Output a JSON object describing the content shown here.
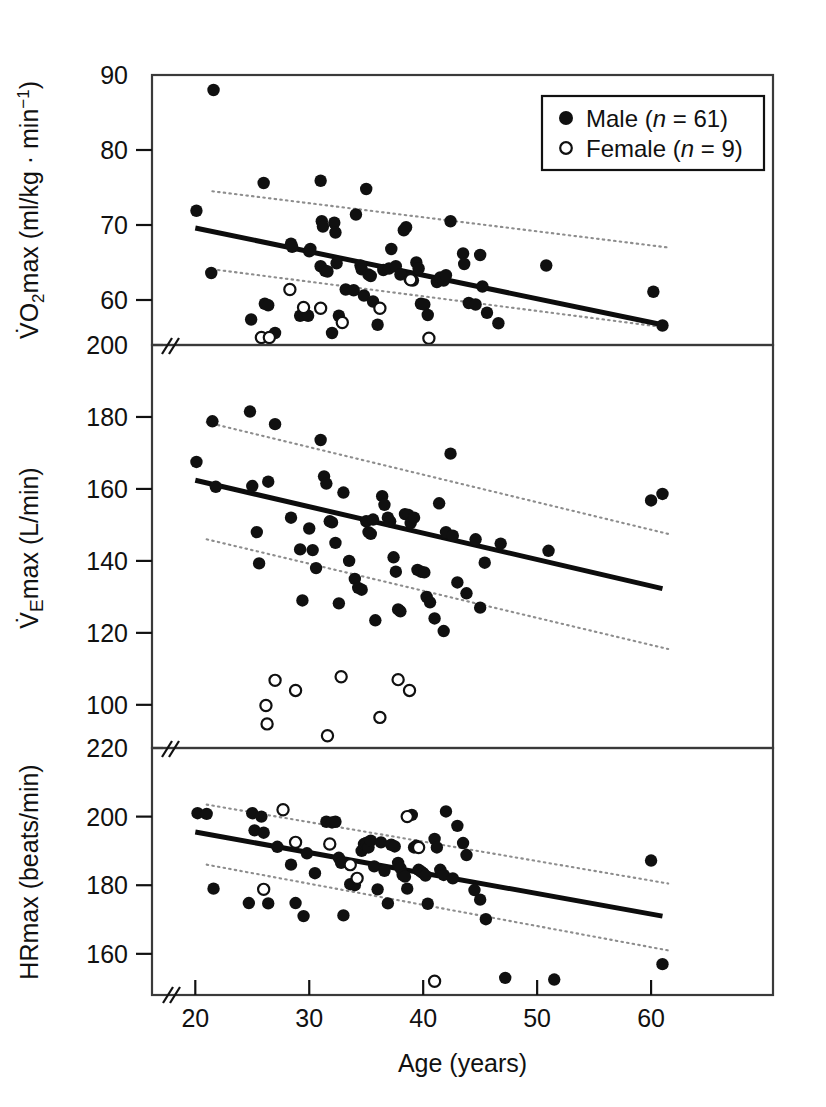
{
  "figure": {
    "xlabel": "Age (years)",
    "legend": {
      "male_label": "Male (",
      "male_n_sym": "n",
      "male_n_val": " = 61)",
      "female_label": "Female (",
      "female_n_sym": "n",
      "female_n_val": " = 9)",
      "male_marker": "filled-circle",
      "female_marker": "open-circle"
    },
    "colors": {
      "ink": "#111111",
      "marker": "#101010",
      "ci_line": "#8d8d8d",
      "frame": "#3a3a3a"
    },
    "axis_break_glyph": "//"
  },
  "chart_data": [
    {
      "type": "scatter",
      "panel": "top",
      "title": "",
      "xlabel": "Age (years)",
      "ylabel": "VO2max (ml/kg · min-1)",
      "ylabel_parts": {
        "lead": "V",
        "dot": "̇",
        "o": "O",
        "sub": "2",
        "mid": "max (ml/kg · min",
        "sup": "−1",
        "tail": ")"
      },
      "xlim": [
        16.2,
        70.7
      ],
      "ylim": [
        54.0,
        90.0
      ],
      "xticks": [
        20,
        30,
        40,
        50,
        60
      ],
      "yticks": [
        60,
        70,
        80,
        90
      ],
      "grid": false,
      "regression": {
        "x": [
          20,
          61
        ],
        "y": [
          69.6,
          56.7
        ]
      },
      "ci_upper": {
        "x": [
          21.5,
          61.5
        ],
        "y": [
          74.5,
          67.0
        ]
      },
      "ci_lower": {
        "x": [
          21.5,
          61.5
        ],
        "y": [
          64.1,
          56.3
        ]
      },
      "series": [
        {
          "name": "Male (n = 61)",
          "marker": "filled-circle",
          "points": [
            [
              20.1,
              71.9
            ],
            [
              21.6,
              88.0
            ],
            [
              21.4,
              63.6
            ],
            [
              24.9,
              57.4
            ],
            [
              26.0,
              75.6
            ],
            [
              26.1,
              59.5
            ],
            [
              26.4,
              59.3
            ],
            [
              27.0,
              55.6
            ],
            [
              28.4,
              67.5
            ],
            [
              28.5,
              67.1
            ],
            [
              29.2,
              57.9
            ],
            [
              29.9,
              57.9
            ],
            [
              30.0,
              66.5
            ],
            [
              30.1,
              66.8
            ],
            [
              31.0,
              75.9
            ],
            [
              31.1,
              70.5
            ],
            [
              31.2,
              69.8
            ],
            [
              31.0,
              64.5
            ],
            [
              31.4,
              63.9
            ],
            [
              31.6,
              63.8
            ],
            [
              32.2,
              70.3
            ],
            [
              32.3,
              69.0
            ],
            [
              32.4,
              64.9
            ],
            [
              32.0,
              55.6
            ],
            [
              32.6,
              57.9
            ],
            [
              33.2,
              61.4
            ],
            [
              33.9,
              61.3
            ],
            [
              34.1,
              71.4
            ],
            [
              34.5,
              64.6
            ],
            [
              34.6,
              64.1
            ],
            [
              34.8,
              60.6
            ],
            [
              35.0,
              74.8
            ],
            [
              35.2,
              63.4
            ],
            [
              35.4,
              63.2
            ],
            [
              35.6,
              59.8
            ],
            [
              36.0,
              56.7
            ],
            [
              36.5,
              64.0
            ],
            [
              37.0,
              64.2
            ],
            [
              37.2,
              66.8
            ],
            [
              37.6,
              64.5
            ],
            [
              38.0,
              63.4
            ],
            [
              38.3,
              69.3
            ],
            [
              38.5,
              69.7
            ],
            [
              38.8,
              62.8
            ],
            [
              39.1,
              62.6
            ],
            [
              39.4,
              65.0
            ],
            [
              39.6,
              64.2
            ],
            [
              39.8,
              59.5
            ],
            [
              40.1,
              59.4
            ],
            [
              40.4,
              58.0
            ],
            [
              41.2,
              62.4
            ],
            [
              41.5,
              63.0
            ],
            [
              41.8,
              62.6
            ],
            [
              42.0,
              63.3
            ],
            [
              42.4,
              70.5
            ],
            [
              43.5,
              66.2
            ],
            [
              43.6,
              64.8
            ],
            [
              44.0,
              59.6
            ],
            [
              44.6,
              59.4
            ],
            [
              45.0,
              66.0
            ],
            [
              45.2,
              61.8
            ],
            [
              45.6,
              58.3
            ],
            [
              46.6,
              56.9
            ],
            [
              50.8,
              64.6
            ],
            [
              60.2,
              61.1
            ],
            [
              61.0,
              56.6
            ]
          ]
        },
        {
          "name": "Female (n = 9)",
          "marker": "open-circle",
          "points": [
            [
              25.8,
              55.0
            ],
            [
              26.5,
              55.0
            ],
            [
              28.3,
              61.4
            ],
            [
              29.5,
              59.0
            ],
            [
              31.0,
              58.9
            ],
            [
              32.9,
              57.0
            ],
            [
              36.2,
              58.9
            ],
            [
              38.9,
              62.7
            ],
            [
              40.5,
              54.9
            ]
          ]
        }
      ]
    },
    {
      "type": "scatter",
      "panel": "middle",
      "title": "",
      "xlabel": "Age (years)",
      "ylabel": "VEmax (L/min)",
      "ylabel_parts": {
        "lead": "V",
        "dot": "̇",
        "sub": "E",
        "mid": "max (L/min)"
      },
      "xlim": [
        16.2,
        70.7
      ],
      "ylim": [
        88.0,
        200.0
      ],
      "xticks": [
        20,
        30,
        40,
        50,
        60
      ],
      "yticks": [
        100,
        120,
        140,
        160,
        180,
        200
      ],
      "grid": false,
      "regression": {
        "x": [
          20,
          61
        ],
        "y": [
          162.4,
          132.3
        ]
      },
      "ci_upper": {
        "x": [
          21.0,
          61.5
        ],
        "y": [
          178.5,
          147.5
        ]
      },
      "ci_lower": {
        "x": [
          21.0,
          61.5
        ],
        "y": [
          146.0,
          115.5
        ]
      },
      "series": [
        {
          "name": "Male (n = 61)",
          "marker": "filled-circle",
          "points": [
            [
              20.1,
              167.5
            ],
            [
              21.5,
              178.8
            ],
            [
              21.8,
              160.6
            ],
            [
              24.8,
              181.5
            ],
            [
              25.0,
              160.8
            ],
            [
              25.4,
              148.0
            ],
            [
              25.6,
              139.3
            ],
            [
              26.4,
              162.0
            ],
            [
              27.0,
              178.0
            ],
            [
              28.4,
              152.0
            ],
            [
              29.2,
              143.2
            ],
            [
              29.4,
              129.0
            ],
            [
              30.0,
              149.0
            ],
            [
              30.3,
              143.0
            ],
            [
              30.6,
              138.0
            ],
            [
              31.0,
              173.6
            ],
            [
              31.3,
              163.5
            ],
            [
              31.5,
              161.5
            ],
            [
              31.8,
              151.0
            ],
            [
              32.0,
              150.7
            ],
            [
              32.3,
              145.0
            ],
            [
              32.6,
              128.2
            ],
            [
              33.0,
              159.0
            ],
            [
              33.5,
              140.0
            ],
            [
              34.0,
              135.0
            ],
            [
              34.3,
              132.5
            ],
            [
              34.6,
              132.0
            ],
            [
              35.0,
              151.0
            ],
            [
              35.2,
              148.0
            ],
            [
              35.4,
              147.5
            ],
            [
              35.6,
              151.5
            ],
            [
              35.8,
              123.5
            ],
            [
              36.4,
              158.0
            ],
            [
              36.6,
              155.6
            ],
            [
              36.9,
              152.0
            ],
            [
              37.1,
              151.0
            ],
            [
              37.4,
              141.0
            ],
            [
              37.6,
              137.0
            ],
            [
              37.8,
              126.5
            ],
            [
              38.0,
              126.0
            ],
            [
              38.4,
              153.0
            ],
            [
              38.7,
              152.8
            ],
            [
              38.9,
              150.5
            ],
            [
              39.2,
              152.0
            ],
            [
              39.5,
              137.5
            ],
            [
              39.8,
              137.0
            ],
            [
              40.1,
              136.8
            ],
            [
              40.3,
              130.0
            ],
            [
              40.6,
              128.5
            ],
            [
              41.0,
              124.0
            ],
            [
              41.4,
              156.0
            ],
            [
              41.8,
              120.5
            ],
            [
              42.0,
              148.0
            ],
            [
              42.4,
              169.8
            ],
            [
              42.6,
              147.0
            ],
            [
              43.0,
              134.0
            ],
            [
              43.8,
              131.0
            ],
            [
              44.6,
              146.0
            ],
            [
              45.0,
              127.0
            ],
            [
              45.4,
              139.5
            ],
            [
              46.8,
              144.8
            ],
            [
              51.0,
              142.8
            ],
            [
              60.0,
              156.8
            ],
            [
              61.0,
              158.6
            ]
          ]
        },
        {
          "name": "Female (n = 9)",
          "marker": "open-circle",
          "points": [
            [
              26.2,
              99.8
            ],
            [
              26.3,
              94.7
            ],
            [
              27.0,
              106.8
            ],
            [
              28.8,
              104.0
            ],
            [
              31.6,
              91.4
            ],
            [
              32.8,
              107.8
            ],
            [
              36.2,
              96.5
            ],
            [
              37.8,
              107.0
            ],
            [
              38.8,
              104.0
            ]
          ]
        }
      ]
    },
    {
      "type": "scatter",
      "panel": "bottom",
      "title": "",
      "xlabel": "Age (years)",
      "ylabel": "HRmax (beats/min)",
      "ylabel_parts": {
        "text": "HRmax (beats/min)"
      },
      "xlim": [
        16.2,
        70.7
      ],
      "ylim": [
        148.0,
        220.0
      ],
      "xticks": [
        20,
        30,
        40,
        50,
        60
      ],
      "yticks": [
        160,
        180,
        200,
        220
      ],
      "grid": false,
      "regression": {
        "x": [
          20,
          61
        ],
        "y": [
          195.5,
          171.0
        ]
      },
      "ci_upper": {
        "x": [
          21.0,
          61.5
        ],
        "y": [
          203.5,
          180.5
        ]
      },
      "ci_lower": {
        "x": [
          21.0,
          61.5
        ],
        "y": [
          186.0,
          161.0
        ]
      },
      "series": [
        {
          "name": "Male (n = 61)",
          "marker": "filled-circle",
          "points": [
            [
              20.2,
              201.0
            ],
            [
              21.0,
              200.8
            ],
            [
              21.6,
              179.0
            ],
            [
              24.7,
              174.8
            ],
            [
              25.0,
              201.0
            ],
            [
              25.2,
              196.0
            ],
            [
              25.8,
              200.0
            ],
            [
              26.0,
              195.3
            ],
            [
              26.4,
              174.7
            ],
            [
              27.2,
              191.2
            ],
            [
              28.4,
              186.0
            ],
            [
              28.8,
              174.8
            ],
            [
              29.5,
              171.0
            ],
            [
              29.8,
              189.3
            ],
            [
              30.5,
              183.5
            ],
            [
              31.5,
              198.5
            ],
            [
              32.0,
              198.3
            ],
            [
              32.3,
              198.5
            ],
            [
              32.6,
              188.0
            ],
            [
              32.8,
              186.5
            ],
            [
              33.0,
              171.2
            ],
            [
              33.6,
              180.3
            ],
            [
              34.0,
              180.0
            ],
            [
              34.6,
              190.0
            ],
            [
              34.8,
              192.0
            ],
            [
              35.0,
              192.3
            ],
            [
              35.2,
              191.0
            ],
            [
              35.4,
              193.0
            ],
            [
              35.7,
              185.5
            ],
            [
              36.0,
              178.8
            ],
            [
              36.3,
              192.5
            ],
            [
              36.6,
              184.2
            ],
            [
              36.9,
              174.7
            ],
            [
              37.2,
              191.8
            ],
            [
              37.5,
              191.3
            ],
            [
              37.8,
              186.5
            ],
            [
              38.0,
              185.0
            ],
            [
              38.2,
              183.0
            ],
            [
              38.4,
              182.5
            ],
            [
              38.6,
              179.0
            ],
            [
              39.0,
              200.5
            ],
            [
              39.2,
              191.0
            ],
            [
              39.4,
              191.5
            ],
            [
              39.6,
              184.5
            ],
            [
              39.8,
              184.0
            ],
            [
              40.0,
              183.5
            ],
            [
              40.2,
              182.8
            ],
            [
              40.4,
              174.6
            ],
            [
              41.0,
              193.5
            ],
            [
              41.2,
              191.0
            ],
            [
              41.5,
              184.5
            ],
            [
              41.8,
              183.0
            ],
            [
              42.0,
              201.5
            ],
            [
              42.6,
              182.0
            ],
            [
              43.0,
              197.3
            ],
            [
              43.5,
              192.3
            ],
            [
              43.8,
              188.8
            ],
            [
              44.5,
              178.6
            ],
            [
              45.0,
              175.8
            ],
            [
              45.5,
              170.1
            ],
            [
              47.2,
              153.0
            ],
            [
              51.5,
              152.5
            ],
            [
              60.0,
              187.2
            ],
            [
              61.0,
              157.0
            ]
          ]
        },
        {
          "name": "Female (n = 9)",
          "marker": "open-circle",
          "points": [
            [
              26.0,
              178.8
            ],
            [
              27.7,
              202.0
            ],
            [
              28.8,
              192.5
            ],
            [
              31.8,
              192.0
            ],
            [
              33.6,
              186.0
            ],
            [
              34.2,
              182.0
            ],
            [
              38.6,
              200.0
            ],
            [
              39.6,
              191.0
            ],
            [
              41.0,
              152.0
            ]
          ]
        }
      ]
    }
  ]
}
